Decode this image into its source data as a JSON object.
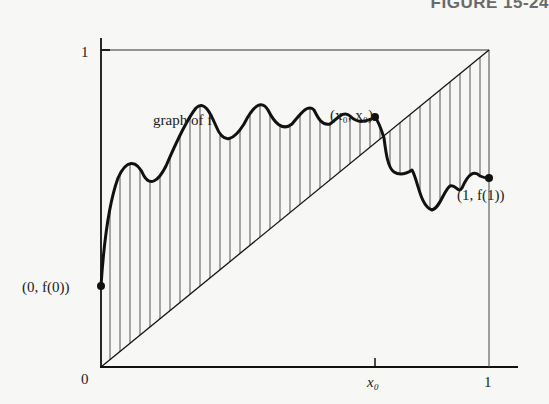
{
  "figure": {
    "title": "FIGURE 15-24",
    "labels": {
      "graph": "graph of f",
      "fixed_point": "(x₀, x₀)",
      "left_endpoint": "(0, f(0))",
      "right_endpoint": "(1, f(1))",
      "origin": "0",
      "x_one": "1",
      "y_one": "1",
      "x0_tick": "x₀"
    },
    "colors": {
      "ink": "#111111",
      "hatch": "#555555",
      "background": "#f7f7f5"
    }
  }
}
